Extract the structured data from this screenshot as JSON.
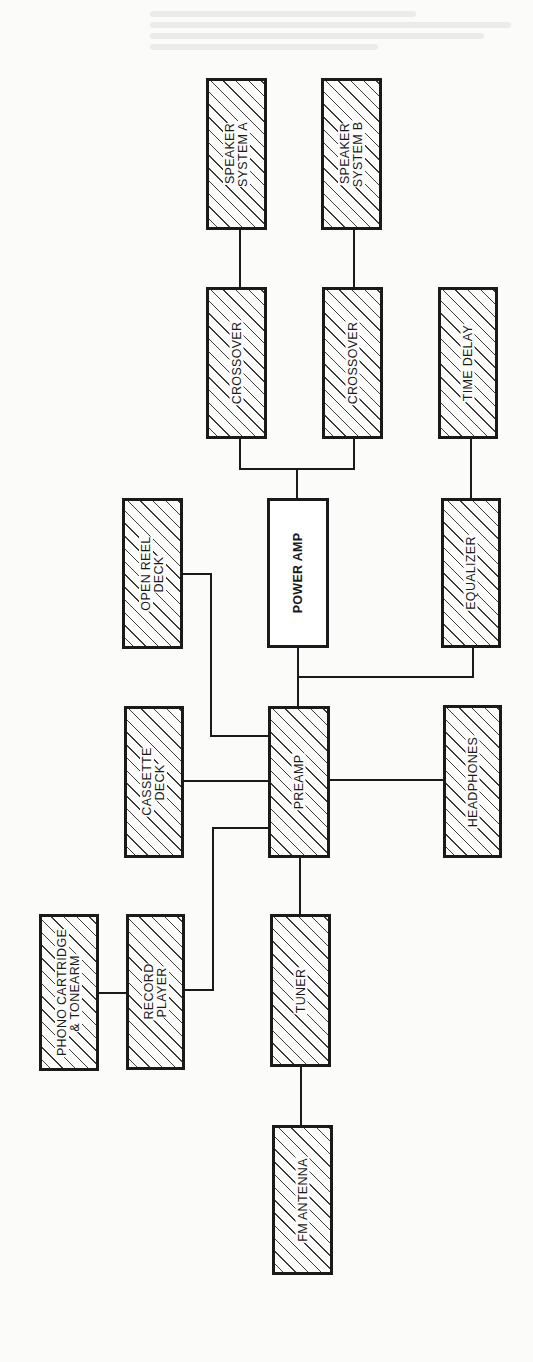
{
  "diagram": {
    "type": "audio-system-block-diagram",
    "orientation": "rotated-90-ccw",
    "colors": {
      "line": "#1a1a1a",
      "hatch": "#3a3a3a",
      "background": "#fbfbfa"
    },
    "nodes": [
      {
        "id": "speaker_a",
        "label": "SPEAKER\nSYSTEM A",
        "hatched": true,
        "x": 206,
        "y": 78,
        "w": 61,
        "h": 152
      },
      {
        "id": "speaker_b",
        "label": "SPEAKER\nSYSTEM B",
        "hatched": true,
        "x": 321,
        "y": 78,
        "w": 61,
        "h": 152
      },
      {
        "id": "crossover_a",
        "label": "CROSSOVER",
        "hatched": true,
        "x": 206,
        "y": 287,
        "w": 61,
        "h": 152
      },
      {
        "id": "crossover_b",
        "label": "CROSSOVER",
        "hatched": true,
        "x": 322,
        "y": 287,
        "w": 61,
        "h": 152
      },
      {
        "id": "time_delay",
        "label": "TIME DELAY",
        "hatched": true,
        "x": 438,
        "y": 287,
        "w": 60,
        "h": 152
      },
      {
        "id": "open_reel",
        "label": "OPEN REEL\nDECK",
        "hatched": true,
        "x": 122,
        "y": 498,
        "w": 61,
        "h": 151
      },
      {
        "id": "power_amp",
        "label": "POWER AMP",
        "hatched": false,
        "x": 267,
        "y": 498,
        "w": 62,
        "h": 150
      },
      {
        "id": "equalizer",
        "label": "EQUALIZER",
        "hatched": true,
        "x": 441,
        "y": 498,
        "w": 60,
        "h": 150
      },
      {
        "id": "cassette",
        "label": "CASSETTE\nDECK",
        "hatched": true,
        "x": 124,
        "y": 706,
        "w": 60,
        "h": 152
      },
      {
        "id": "preamp",
        "label": "PREAMP",
        "hatched": true,
        "x": 268,
        "y": 706,
        "w": 62,
        "h": 152
      },
      {
        "id": "headphones",
        "label": "HEADPHONES",
        "hatched": true,
        "x": 443,
        "y": 705,
        "w": 59,
        "h": 153
      },
      {
        "id": "phono",
        "label": "PHONO CARTRIDGE\n& TONEARM",
        "hatched": true,
        "x": 39,
        "y": 914,
        "w": 60,
        "h": 157
      },
      {
        "id": "record_player",
        "label": "RECORD\nPLAYER",
        "hatched": true,
        "x": 126,
        "y": 914,
        "w": 59,
        "h": 156
      },
      {
        "id": "tuner",
        "label": "TUNER",
        "hatched": true,
        "x": 270,
        "y": 914,
        "w": 61,
        "h": 153
      },
      {
        "id": "fm_antenna",
        "label": "FM ANTENNA",
        "hatched": true,
        "x": 272,
        "y": 1125,
        "w": 61,
        "h": 150
      }
    ],
    "connections": [
      {
        "from": "speaker_a",
        "to": "crossover_a",
        "points": [
          [
            240,
            230
          ],
          [
            240,
            287
          ]
        ]
      },
      {
        "from": "speaker_b",
        "to": "crossover_b",
        "points": [
          [
            354,
            230
          ],
          [
            354,
            287
          ]
        ]
      },
      {
        "from": "crossover_a",
        "to": "power_amp",
        "points": [
          [
            240,
            439
          ],
          [
            240,
            469
          ],
          [
            354,
            469
          ],
          [
            354,
            439
          ]
        ]
      },
      {
        "from": "junction",
        "to": "power_amp",
        "points": [
          [
            297,
            469
          ],
          [
            297,
            498
          ]
        ]
      },
      {
        "from": "time_delay",
        "to": "equalizer",
        "points": [
          [
            471,
            439
          ],
          [
            471,
            498
          ]
        ]
      },
      {
        "from": "power_amp",
        "to": "preamp",
        "points": [
          [
            298,
            648
          ],
          [
            298,
            706
          ]
        ]
      },
      {
        "from": "equalizer",
        "to": "junction",
        "points": [
          [
            473,
            648
          ],
          [
            473,
            677
          ],
          [
            298,
            677
          ]
        ]
      },
      {
        "from": "open_reel",
        "to": "preamp",
        "points": [
          [
            183,
            574
          ],
          [
            211,
            574
          ],
          [
            211,
            736
          ],
          [
            268,
            736
          ]
        ]
      },
      {
        "from": "cassette",
        "to": "preamp",
        "points": [
          [
            184,
            781
          ],
          [
            268,
            781
          ]
        ]
      },
      {
        "from": "preamp",
        "to": "headphones",
        "points": [
          [
            330,
            780
          ],
          [
            443,
            780
          ]
        ]
      },
      {
        "from": "record_player",
        "to": "preamp",
        "points": [
          [
            185,
            990
          ],
          [
            213,
            990
          ],
          [
            213,
            828
          ],
          [
            268,
            828
          ]
        ]
      },
      {
        "from": "phono",
        "to": "record_player",
        "points": [
          [
            99,
            993
          ],
          [
            126,
            993
          ]
        ]
      },
      {
        "from": "preamp",
        "to": "tuner",
        "points": [
          [
            300,
            858
          ],
          [
            300,
            914
          ]
        ]
      },
      {
        "from": "tuner",
        "to": "fm_antenna",
        "points": [
          [
            301,
            1067
          ],
          [
            301,
            1125
          ]
        ]
      }
    ]
  }
}
